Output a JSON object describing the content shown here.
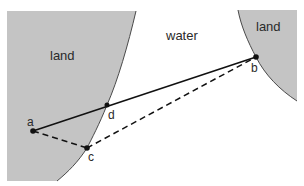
{
  "diagram": {
    "regions": {
      "left_land": "land",
      "water": "water",
      "right_land": "land"
    },
    "points": {
      "a": "a",
      "b": "b",
      "c": "c",
      "d": "d"
    },
    "colors": {
      "land": "#c4c4c4",
      "water": "#ffffff",
      "shore": "#4a4a4a",
      "path": "#111111"
    },
    "paths": [
      {
        "from": "a",
        "to": "b",
        "style": "solid",
        "via": "d"
      },
      {
        "from": "a",
        "to": "c",
        "style": "dashed"
      },
      {
        "from": "c",
        "to": "b",
        "style": "dashed"
      }
    ]
  }
}
